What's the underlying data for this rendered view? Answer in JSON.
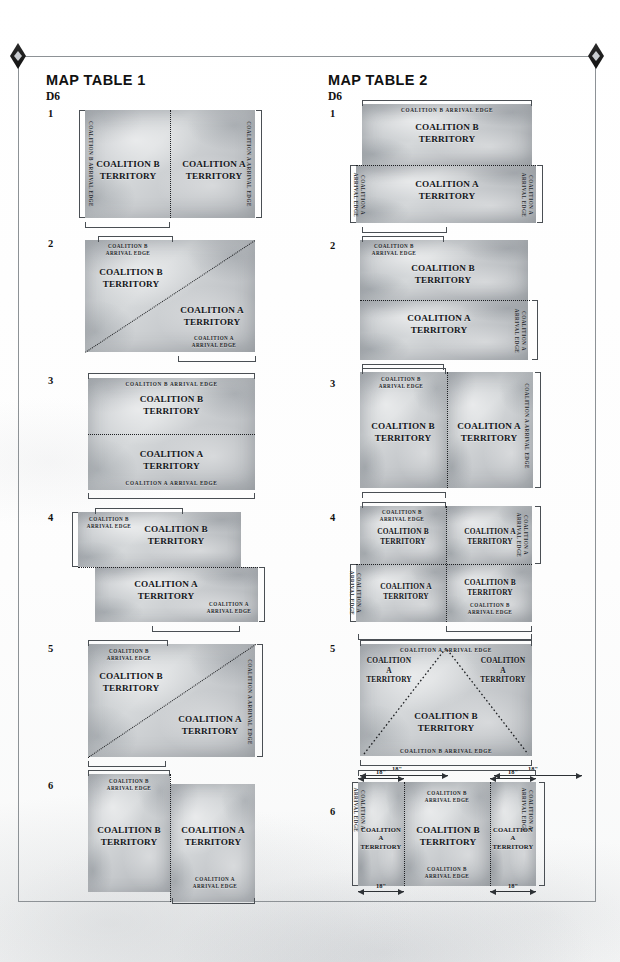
{
  "page": {
    "background_color": "#ffffff",
    "frame_color": "#8d9296"
  },
  "labels": {
    "coalition_a_territory": "COALITION A\nTERRITORY",
    "coalition_b_territory": "COALITION B\nTERRITORY",
    "coalition_a_arrival_edge": "COALITION A\nARRIVAL EDGE",
    "coalition_b_arrival_edge": "COALITION B\nARRIVAL EDGE",
    "coalition_a_arrival_edge_1line": "COALITION A ARRIVAL EDGE",
    "coalition_b_arrival_edge_1line": "COALITION B ARRIVAL EDGE",
    "coalition_a_territory_3line": "COALITION\nA\nTERRITORY",
    "measure_18": "18\""
  },
  "tables": [
    {
      "title": "MAP TABLE 1",
      "die_label": "D6",
      "rows": [
        {
          "number": "1",
          "layout": "vertical-split",
          "description": "Board split down the middle vertically; Coalition B territory on the left with its arrival edge along the left board side, Coalition A territory on the right with its arrival edge along the right board side."
        },
        {
          "number": "2",
          "layout": "diagonal-split",
          "description": "Board split along a diagonal running from the bottom-left corner to the top-right corner; Coalition B territory occupies the upper-left triangle with its arrival edge along the top, Coalition A territory occupies the lower-right triangle with its arrival edge along the bottom."
        },
        {
          "number": "3",
          "layout": "horizontal-split",
          "description": "Board split across the middle horizontally; Coalition B territory on top with its arrival edge along the top, Coalition A territory on the bottom with its arrival edge along the bottom."
        },
        {
          "number": "4",
          "layout": "offset-horizontal-split",
          "description": "Board split horizontally with the two halves offset sideways; Coalition B territory upper half shifted left with its arrival edge at the top-left, Coalition A territory lower half shifted right with its arrival edge at the bottom-right."
        },
        {
          "number": "5",
          "layout": "diagonal-split",
          "description": "Board split along a diagonal from the bottom-left corner to the top-right corner; Coalition B territory upper-left with arrival edge along the top, Coalition A territory lower-right with arrival edge along the right side."
        },
        {
          "number": "6",
          "layout": "offset-vertical-split",
          "description": "Board split vertically with the two halves offset up and down; Coalition B territory left half raised with its arrival edge at the top, Coalition A territory right half lowered with its arrival edge at the bottom."
        }
      ]
    },
    {
      "title": "MAP TABLE 2",
      "die_label": "D6",
      "rows": [
        {
          "number": "1",
          "layout": "horizontal-split-offset",
          "description": "Board split horizontally; Coalition B territory on top with its arrival edge along the top, Coalition A territory on the bottom with arrival edges down both the left and right sides of the lower half."
        },
        {
          "number": "2",
          "layout": "horizontal-split",
          "description": "Board split horizontally; Coalition B territory on top with its arrival edge at the top-left, Coalition A territory on the bottom with its arrival edge along the right side of the lower half."
        },
        {
          "number": "3",
          "layout": "vertical-split",
          "description": "Board split vertically; Coalition B territory on the left with its arrival edge at the top-left, Coalition A territory on the right with its arrival edge along the right side."
        },
        {
          "number": "4",
          "layout": "quadrants",
          "description": "Board divided into four quadrants; Coalition B upper-left with arrival edge at the top-left, Coalition A upper-right with arrival edge on the right, Coalition A lower-left with arrival edge on the left, Coalition B lower-right with arrival edge at the bottom."
        },
        {
          "number": "5",
          "layout": "central-triangle",
          "description": "A large central triangle of Coalition B territory rises from the bottom edge; Coalition A territory fills the two upper corners. Coalition A arrival edge runs along the top, Coalition B arrival edge along the bottom. Flanking measurements of 18 inches are marked at the bottom left and bottom right."
        },
        {
          "number": "6",
          "layout": "three-vertical-bands",
          "description": "Board divided into three vertical bands; Coalition A territory occupies the left and right 18 inch bands, each with its own arrival edge on the outer side, and Coalition B territory occupies the wide central band with arrival edges along both its top and bottom."
        }
      ]
    }
  ],
  "measurements": [
    {
      "value": "18\"",
      "position": "table-2 row 5 bottom-left"
    },
    {
      "value": "18\"",
      "position": "table-2 row 5 bottom-right"
    },
    {
      "value": "18\"",
      "position": "table-2 row 6 top-left"
    },
    {
      "value": "18\"",
      "position": "table-2 row 6 top-right"
    },
    {
      "value": "18\"",
      "position": "table-2 row 6 bottom-left"
    },
    {
      "value": "18\"",
      "position": "table-2 row 6 bottom-right"
    }
  ]
}
